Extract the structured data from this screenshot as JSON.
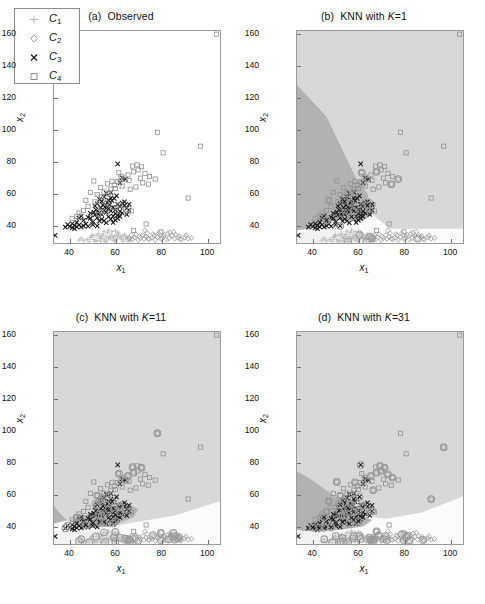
{
  "figure": {
    "axis_labels": {
      "x": "x",
      "x_sub": "1",
      "y": "x",
      "y_sub": "2"
    },
    "colors": {
      "region_c1": "#f2f2f2",
      "region_c2": "#fbfbfb",
      "region_c3": "#b2b2b2",
      "region_c4": "#d8d8d8",
      "marker_c1": "#b9b9b9",
      "marker_c2": "#9b9b9b",
      "marker_c3": "#1a1a1a",
      "marker_c4": "#8f8f8f",
      "highlight_circle": "#9a9a9a",
      "axis": "#9a9a9a"
    }
  },
  "legend": {
    "entries": [
      {
        "label": "C",
        "sub": "1",
        "marker": "plus-marker"
      },
      {
        "label": "C",
        "sub": "2",
        "marker": "diamond-marker"
      },
      {
        "label": "C",
        "sub": "3",
        "marker": "cross-marker"
      },
      {
        "label": "C",
        "sub": "4",
        "marker": "square-marker"
      }
    ]
  },
  "panels": [
    {
      "id": "a",
      "tag": "(a)",
      "title": "Observed",
      "k": null,
      "has_regions": false,
      "has_highlights": false
    },
    {
      "id": "b",
      "tag": "(b)",
      "title": "KNN with ",
      "k": "=1",
      "k_var": "K",
      "has_regions": true,
      "has_highlights": true
    },
    {
      "id": "c",
      "tag": "(c)",
      "title": "KNN with ",
      "k": "=11",
      "k_var": "K",
      "has_regions": true,
      "has_highlights": true
    },
    {
      "id": "d",
      "tag": "(d)",
      "title": "KNN with ",
      "k": "=31",
      "k_var": "K",
      "has_regions": true,
      "has_highlights": true
    }
  ],
  "chart_data": {
    "type": "scatter",
    "xlabel": "x_1",
    "ylabel": "x_2",
    "xlim": [
      33,
      106
    ],
    "ylim": [
      28,
      162
    ],
    "xticks": [
      40,
      60,
      80,
      100
    ],
    "yticks": [
      40,
      60,
      80,
      100,
      120,
      140,
      160
    ],
    "grid": false,
    "legend_position": "upper-left (panel a only)",
    "classes": [
      "C1",
      "C2",
      "C3",
      "C4"
    ],
    "class_markers": {
      "C1": "plus",
      "C2": "diamond",
      "C3": "x",
      "C4": "square"
    },
    "series": [
      {
        "name": "C1",
        "marker": "plus",
        "points": [
          [
            50.5,
            30.2
          ],
          [
            52,
            29.6
          ],
          [
            53.5,
            31.0
          ],
          [
            55,
            30.4
          ],
          [
            56,
            29.2
          ],
          [
            57.5,
            31.6
          ],
          [
            58.5,
            30.0
          ],
          [
            60,
            29.4
          ],
          [
            61,
            31.2
          ],
          [
            62.5,
            30.6
          ],
          [
            63.5,
            29.0
          ],
          [
            54.5,
            33.4
          ],
          [
            56.5,
            34.6
          ],
          [
            58,
            33.0
          ],
          [
            59.5,
            32.2
          ],
          [
            61.5,
            33.8
          ],
          [
            63,
            32.6
          ],
          [
            64.5,
            31.4
          ],
          [
            49,
            31.4
          ],
          [
            47.5,
            30.2
          ],
          [
            46,
            29.4
          ],
          [
            51.5,
            32.8
          ],
          [
            53,
            31.8
          ],
          [
            64,
            33.2
          ],
          [
            65.5,
            30.8
          ],
          [
            66.5,
            29.6
          ],
          [
            55.5,
            29.0
          ],
          [
            57,
            30.8
          ],
          [
            59,
            31.6
          ],
          [
            60.5,
            33.0
          ],
          [
            62,
            32.0
          ],
          [
            48.5,
            29.0
          ],
          [
            50,
            33.0
          ],
          [
            52.5,
            34.0
          ],
          [
            54,
            32.4
          ],
          [
            65,
            32.0
          ],
          [
            58.5,
            35.2
          ],
          [
            61,
            34.8
          ],
          [
            56,
            32.0
          ],
          [
            53.5,
            29.2
          ],
          [
            59.5,
            29.6
          ],
          [
            63,
            30.2
          ],
          [
            45,
            31.0
          ],
          [
            44,
            29.8
          ],
          [
            67,
            31.0
          ],
          [
            60,
            35.6
          ],
          [
            57,
            36.2
          ],
          [
            51,
            29.0
          ],
          [
            49.5,
            32.4
          ],
          [
            55,
            35.4
          ]
        ]
      },
      {
        "name": "C2",
        "marker": "diamond",
        "points": [
          [
            66,
            31.0
          ],
          [
            67.5,
            30.2
          ],
          [
            68.5,
            31.6
          ],
          [
            70,
            30.0
          ],
          [
            71,
            31.2
          ],
          [
            72.5,
            30.6
          ],
          [
            73.5,
            32.0
          ],
          [
            75,
            30.4
          ],
          [
            76,
            31.4
          ],
          [
            77.5,
            30.0
          ],
          [
            78.5,
            31.8
          ],
          [
            80,
            30.6
          ],
          [
            81,
            32.2
          ],
          [
            82.5,
            30.2
          ],
          [
            83.5,
            31.0
          ],
          [
            85,
            32.6
          ],
          [
            86,
            30.8
          ],
          [
            87.5,
            31.4
          ],
          [
            89,
            30.2
          ],
          [
            90.5,
            31.6
          ],
          [
            92,
            30.8
          ],
          [
            93.5,
            31.2
          ],
          [
            69,
            33.4
          ],
          [
            72,
            33.0
          ],
          [
            74,
            34.2
          ],
          [
            76.5,
            33.6
          ],
          [
            79,
            34.0
          ],
          [
            81.5,
            33.2
          ],
          [
            84,
            34.6
          ],
          [
            86.5,
            33.0
          ],
          [
            88,
            32.4
          ],
          [
            91,
            32.8
          ],
          [
            73,
            36.0
          ],
          [
            67,
            33.0
          ],
          [
            70.5,
            32.2
          ],
          [
            77,
            32.8
          ],
          [
            83,
            33.8
          ],
          [
            85.5,
            35.0
          ],
          [
            80.5,
            31.0
          ],
          [
            74.5,
            30.8
          ],
          [
            65.5,
            30.0
          ],
          [
            88.5,
            30.6
          ]
        ]
      },
      {
        "name": "C3",
        "marker": "x",
        "points": [
          [
            33.5,
            32.8
          ],
          [
            38,
            38.0
          ],
          [
            39,
            39.6
          ],
          [
            40,
            38.4
          ],
          [
            41,
            40.2
          ],
          [
            42,
            39.0
          ],
          [
            43,
            41.0
          ],
          [
            44,
            39.4
          ],
          [
            45,
            38.2
          ],
          [
            46,
            42.4
          ],
          [
            47,
            40.0
          ],
          [
            48,
            38.6
          ],
          [
            49,
            43.6
          ],
          [
            50,
            41.2
          ],
          [
            51,
            45.8
          ],
          [
            52,
            44.0
          ],
          [
            53,
            47.2
          ],
          [
            54,
            46.0
          ],
          [
            55,
            48.6
          ],
          [
            56,
            47.4
          ],
          [
            57,
            49.8
          ],
          [
            58,
            48.2
          ],
          [
            59,
            50.6
          ],
          [
            60,
            49.0
          ],
          [
            61,
            52.4
          ],
          [
            62,
            51.0
          ],
          [
            63,
            53.2
          ],
          [
            64,
            51.8
          ],
          [
            53.5,
            50.2
          ],
          [
            54.5,
            52.0
          ],
          [
            55.5,
            50.8
          ],
          [
            56.5,
            53.4
          ],
          [
            57.5,
            52.2
          ],
          [
            58.5,
            54.8
          ],
          [
            50.5,
            47.6
          ],
          [
            51.5,
            49.0
          ],
          [
            52.5,
            46.4
          ],
          [
            59.5,
            56.2
          ],
          [
            60.5,
            57.8
          ],
          [
            55,
            57.0
          ],
          [
            56,
            59.4
          ],
          [
            58,
            60.0
          ],
          [
            61,
            78.0
          ],
          [
            63,
            69.2
          ],
          [
            64.5,
            68.4
          ],
          [
            62,
            66.0
          ],
          [
            57,
            44.6
          ],
          [
            58,
            43.2
          ],
          [
            59,
            45.0
          ],
          [
            60,
            46.6
          ],
          [
            61,
            45.4
          ],
          [
            62,
            48.0
          ],
          [
            63,
            47.0
          ],
          [
            65,
            50.0
          ],
          [
            66,
            52.4
          ],
          [
            53,
            41.8
          ],
          [
            54,
            43.0
          ],
          [
            55,
            42.0
          ],
          [
            56,
            40.8
          ],
          [
            52,
            38.8
          ],
          [
            50,
            39.6
          ],
          [
            48,
            44.2
          ],
          [
            46,
            38.8
          ],
          [
            45,
            45.0
          ],
          [
            44,
            43.8
          ],
          [
            57,
            55.0
          ],
          [
            58,
            56.4
          ],
          [
            54,
            54.2
          ],
          [
            53,
            55.6
          ],
          [
            52,
            52.8
          ],
          [
            51,
            51.4
          ],
          [
            49,
            46.8
          ],
          [
            59,
            41.0
          ],
          [
            60,
            42.4
          ],
          [
            61,
            43.6
          ],
          [
            62,
            44.8
          ],
          [
            64,
            54.0
          ],
          [
            65,
            46.0
          ],
          [
            66,
            48.8
          ],
          [
            43,
            38.2
          ],
          [
            42,
            37.0
          ],
          [
            41,
            37.6
          ]
        ]
      },
      {
        "name": "C4",
        "marker": "square",
        "points": [
          [
            104.5,
            160.0
          ],
          [
            97.5,
            89.2
          ],
          [
            81,
            85.0
          ],
          [
            78.5,
            98.0
          ],
          [
            92,
            56.4
          ],
          [
            77.5,
            68.4
          ],
          [
            74.5,
            65.2
          ],
          [
            73,
            72.0
          ],
          [
            71,
            69.0
          ],
          [
            69.5,
            77.4
          ],
          [
            67.5,
            76.6
          ],
          [
            65.5,
            71.0
          ],
          [
            64,
            68.0
          ],
          [
            62.5,
            70.2
          ],
          [
            61,
            66.8
          ],
          [
            59.5,
            64.6
          ],
          [
            58,
            62.0
          ],
          [
            56.5,
            65.4
          ],
          [
            55,
            60.2
          ],
          [
            53.5,
            63.0
          ],
          [
            52,
            58.6
          ],
          [
            50.5,
            67.2
          ],
          [
            49,
            60.0
          ],
          [
            47,
            55.0
          ],
          [
            44,
            47.0
          ],
          [
            41,
            43.6
          ],
          [
            43,
            44.8
          ],
          [
            46,
            48.6
          ],
          [
            48,
            51.2
          ],
          [
            51,
            54.0
          ],
          [
            54,
            57.2
          ],
          [
            57,
            59.0
          ],
          [
            60,
            62.4
          ],
          [
            63,
            64.0
          ],
          [
            66,
            67.6
          ],
          [
            68,
            73.0
          ],
          [
            70,
            74.2
          ],
          [
            72,
            66.0
          ],
          [
            75,
            70.0
          ],
          [
            73.5,
            40.0
          ],
          [
            67,
            48.2
          ],
          [
            64.5,
            49.0
          ],
          [
            62,
            52.0
          ],
          [
            59,
            50.4
          ],
          [
            56,
            53.2
          ],
          [
            58.5,
            67.0
          ],
          [
            61.5,
            72.4
          ],
          [
            66.5,
            62.0
          ],
          [
            69,
            63.4
          ],
          [
            71.5,
            76.2
          ],
          [
            54,
            48.0
          ],
          [
            52.5,
            46.0
          ],
          [
            68,
            36.0
          ],
          [
            80,
            35.0
          ]
        ]
      }
    ],
    "decision_regions": {
      "description": "Shaded KNN decision regions: light-gray (C4) upper area, medium-gray (C3) band through the cluster, near-white (C2) lower-right wedge, very light (C1) lower-left strip.",
      "region_classes": [
        "C1",
        "C2",
        "C3",
        "C4"
      ]
    },
    "highlights": {
      "description": "Large open gray circles overlay misclassified points in panels (b), (c) and (d); count grows with K.",
      "marker": "circle"
    }
  }
}
